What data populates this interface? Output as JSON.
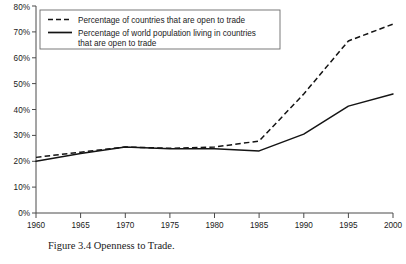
{
  "figure": {
    "caption": "Figure 3.4 Openness to Trade.",
    "caption_secondary": ""
  },
  "legend": {
    "position": "top-left-inside",
    "entries": [
      {
        "label": "Percentage of countries that are open to trade",
        "style": "dashed"
      },
      {
        "label": "Percentage of world population living in countries",
        "label_line2": "that are open to trade",
        "style": "solid"
      }
    ]
  },
  "axes": {
    "x_ticks": [
      "1960",
      "1965",
      "1970",
      "1975",
      "1980",
      "1985",
      "1990",
      "1995",
      "2000"
    ],
    "y_ticks": [
      "0%",
      "10%",
      "20%",
      "30%",
      "40%",
      "50%",
      "60%",
      "70%",
      "80%"
    ]
  },
  "chart_data": {
    "type": "line",
    "title": "Figure 3.4 Openness to Trade.",
    "xlabel": "",
    "ylabel": "",
    "xlim": [
      1960,
      2000
    ],
    "ylim": [
      0,
      80
    ],
    "grid": false,
    "legend_position": "upper left",
    "x": [
      1960,
      1965,
      1970,
      1975,
      1980,
      1985,
      1990,
      1995,
      2000
    ],
    "x_tick_labels": [
      "1960",
      "1965",
      "1970",
      "1975",
      "1980",
      "1985",
      "1990",
      "1995",
      "2000"
    ],
    "y_tick_labels": [
      "0%",
      "10%",
      "20%",
      "30%",
      "40%",
      "50%",
      "60%",
      "70%",
      "80%"
    ],
    "y_unit": "percent",
    "series": [
      {
        "name": "Percentage of countries that are open to trade",
        "style": "dashed",
        "color": "#141414",
        "values": [
          21.5,
          23.5,
          25.5,
          25.0,
          25.5,
          27.8,
          46.0,
          66.5,
          73.0
        ]
      },
      {
        "name": "Percentage of world population living in countries that are open to trade",
        "style": "solid",
        "color": "#141414",
        "values": [
          20.0,
          23.0,
          25.5,
          24.8,
          24.8,
          24.0,
          30.5,
          41.3,
          46.0
        ]
      }
    ]
  }
}
